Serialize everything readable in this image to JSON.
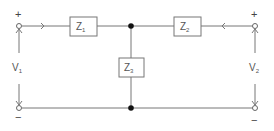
{
  "diagram": {
    "type": "T-network two-port circuit",
    "impedances": [
      {
        "id": "z1",
        "label": "Z",
        "sub": "1"
      },
      {
        "id": "z2",
        "label": "Z",
        "sub": "2"
      },
      {
        "id": "z3",
        "label": "Z",
        "sub": "3"
      }
    ],
    "ports": [
      {
        "id": "port1",
        "voltage": "V",
        "sub": "1",
        "plus": "+",
        "minus": "−"
      },
      {
        "id": "port2",
        "voltage": "V",
        "sub": "2",
        "plus": "+",
        "minus": "−"
      }
    ],
    "colors": {
      "wire": "#777777",
      "node": "#111111",
      "text": "#555555"
    }
  }
}
